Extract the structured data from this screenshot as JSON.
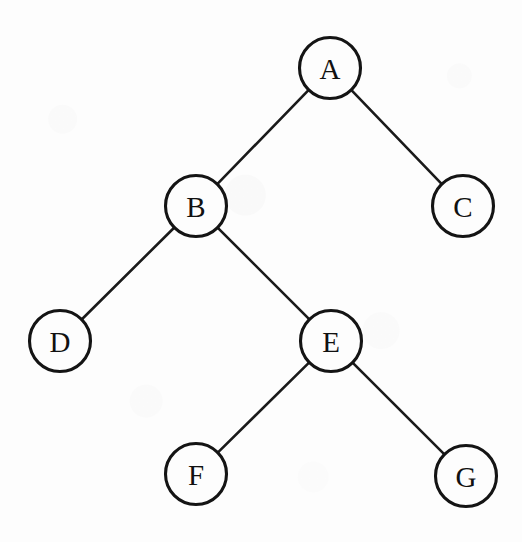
{
  "diagram": {
    "type": "tree-graph",
    "background_color": "#fdfdfd",
    "stroke_color": "#141414",
    "label_color": "#111111",
    "node_radius": 30.5,
    "nodes": [
      {
        "id": "A",
        "label": "A",
        "cx": 330,
        "cy": 68,
        "r": 30.5
      },
      {
        "id": "B",
        "label": "B",
        "cx": 196,
        "cy": 206,
        "r": 30.5
      },
      {
        "id": "C",
        "label": "C",
        "cx": 463,
        "cy": 206,
        "r": 30.5
      },
      {
        "id": "D",
        "label": "D",
        "cx": 60,
        "cy": 341,
        "r": 30.5
      },
      {
        "id": "E",
        "label": "E",
        "cx": 331,
        "cy": 341,
        "r": 30.5
      },
      {
        "id": "F",
        "label": "F",
        "cx": 196,
        "cy": 474,
        "r": 30.5
      },
      {
        "id": "G",
        "label": "G",
        "cx": 466,
        "cy": 476,
        "r": 30.5
      }
    ],
    "edges": [
      {
        "id": "A-B",
        "from": "A",
        "to": "B"
      },
      {
        "id": "A-C",
        "from": "A",
        "to": "C"
      },
      {
        "id": "B-D",
        "from": "B",
        "to": "D"
      },
      {
        "id": "B-E",
        "from": "B",
        "to": "E"
      },
      {
        "id": "E-F",
        "from": "E",
        "to": "F"
      },
      {
        "id": "E-G",
        "from": "E",
        "to": "G"
      }
    ]
  }
}
